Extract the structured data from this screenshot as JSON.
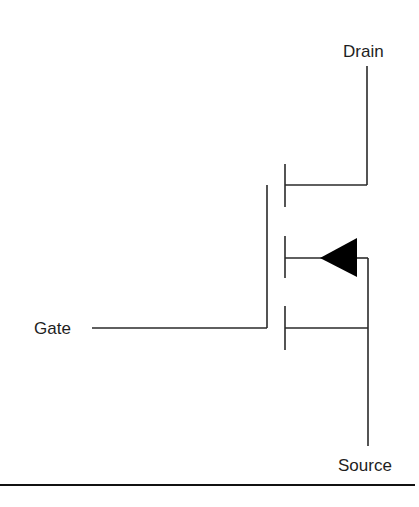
{
  "diagram": {
    "type": "mosfet-schematic",
    "labels": {
      "drain": "Drain",
      "gate": "Gate",
      "source": "Source"
    },
    "colors": {
      "line": "#2a2a2a",
      "arrow_fill": "#000000",
      "text": "#1e1e1e",
      "background": "#ffffff"
    },
    "terminals": [
      {
        "name": "Drain",
        "position": "top-right"
      },
      {
        "name": "Gate",
        "position": "left"
      },
      {
        "name": "Source",
        "position": "bottom-right"
      }
    ],
    "body_arrow": {
      "direction": "left",
      "shape": "filled-triangle"
    }
  }
}
